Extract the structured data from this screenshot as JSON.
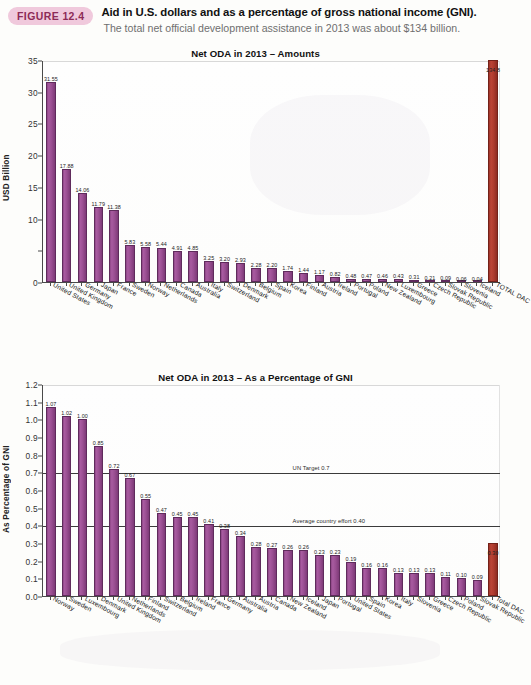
{
  "figure": {
    "badge": "FIGURE 12.4",
    "title": "Aid in U.S. dollars and as a percentage of gross national income (GNI).",
    "subtitle": "The total net official development assistance in 2013 was about $134 billion."
  },
  "chart_data": [
    {
      "type": "bar",
      "title": "Net ODA in 2013 – Amounts",
      "xlabel": "",
      "ylabel": "USD Billion",
      "ylim": [
        0,
        35
      ],
      "yticks": [
        0,
        5,
        10,
        15,
        20,
        25,
        30,
        35
      ],
      "ytick_labels": [
        "0",
        "",
        "10",
        "15",
        "20",
        "25",
        "30",
        "35"
      ],
      "grid": false,
      "legend": "none",
      "bar_color": "#9a4f92",
      "total_color": "#ad3a2d",
      "categories": [
        "United States",
        "United Kingdom",
        "Germany",
        "Japan",
        "France",
        "Sweden",
        "Norway",
        "Netherlands",
        "Canada",
        "Australia",
        "Italy",
        "Switzerland",
        "Denmark",
        "Belgium",
        "Spain",
        "Korea",
        "Finland",
        "Austria",
        "Ireland",
        "Portugal",
        "Poland",
        "New Zealand",
        "Luxembourg",
        "Greece",
        "Czech Republic",
        "Slovak Republic",
        "Slovenia",
        "Iceland",
        "TOTAL DAC"
      ],
      "values": [
        31.55,
        17.88,
        14.06,
        11.79,
        11.38,
        5.83,
        5.58,
        5.44,
        4.91,
        4.85,
        3.25,
        3.2,
        2.93,
        2.28,
        2.2,
        1.74,
        1.44,
        1.17,
        0.82,
        0.48,
        0.47,
        0.46,
        0.43,
        0.31,
        0.21,
        0.09,
        0.06,
        0.04,
        134.8
      ],
      "value_labels": [
        "31.55",
        "17.88",
        "14.06",
        "11.79",
        "11.38",
        "5.83",
        "5.58",
        "5.44",
        "4.91",
        "4.85",
        "3.25",
        "3.20",
        "2.93",
        "2.28",
        "2.20",
        "1.74",
        "1.44",
        "1.17",
        "0.82",
        "0.48",
        "0.47",
        "0.46",
        "0.43",
        "0.31",
        "0.21",
        "0.09",
        "0.06",
        "0.04",
        "134.8"
      ],
      "total_index": 28,
      "annotations": []
    },
    {
      "type": "bar",
      "title": "Net ODA in 2013 – As a Percentage of GNI",
      "xlabel": "",
      "ylabel": "As Percentage of GNI",
      "ylim": [
        0,
        1.2
      ],
      "yticks": [
        0,
        0.1,
        0.2,
        0.3,
        0.4,
        0.5,
        0.6,
        0.7,
        0.8,
        0.9,
        1.0,
        1.1,
        1.2
      ],
      "ytick_labels": [
        "0.0",
        "0.1",
        "0.2",
        "0.3",
        "0.4",
        "0.5",
        "0.6",
        "0.7",
        "0.8",
        "0.9",
        "1.0",
        "1.1",
        "1.2"
      ],
      "grid": false,
      "legend": "none",
      "bar_color": "#9a4f92",
      "total_color": "#ad3a2d",
      "categories": [
        "Norway",
        "Sweden",
        "Luxembourg",
        "Denmark",
        "United Kingdom",
        "Netherlands",
        "Finland",
        "Switzerland",
        "Belgium",
        "Ireland",
        "France",
        "Germany",
        "Australia",
        "Austria",
        "Canada",
        "New Zealand",
        "Iceland",
        "Japan",
        "Portugal",
        "United States",
        "Spain",
        "Korea",
        "Italy",
        "Slovenia",
        "Greece",
        "Czech Republic",
        "Poland",
        "Slovak Republic",
        "Total DAC"
      ],
      "values": [
        1.07,
        1.02,
        1.0,
        0.85,
        0.72,
        0.67,
        0.55,
        0.47,
        0.45,
        0.45,
        0.41,
        0.38,
        0.34,
        0.28,
        0.27,
        0.26,
        0.26,
        0.23,
        0.23,
        0.19,
        0.16,
        0.16,
        0.13,
        0.13,
        0.13,
        0.11,
        0.1,
        0.09,
        0.3
      ],
      "value_labels": [
        "1.07",
        "1.02",
        "1.00",
        "0.85",
        "0.72",
        "0.67",
        "0.55",
        "0.47",
        "0.45",
        "0.45",
        "0.41",
        "0.38",
        "0.34",
        "0.28",
        "0.27",
        "0.26",
        "0.26",
        "0.23",
        "0.23",
        "0.19",
        "0.16",
        "0.16",
        "0.13",
        "0.13",
        "0.13",
        "0.11",
        "0.10",
        "0.09",
        "0.30"
      ],
      "total_index": 28,
      "annotations": [
        {
          "value": 0.7,
          "label": "UN Target 0.7"
        },
        {
          "value": 0.4,
          "label": "Average country effort 0.40"
        }
      ]
    }
  ]
}
